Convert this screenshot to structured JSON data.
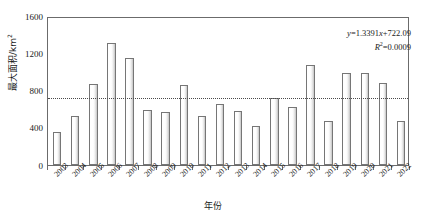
{
  "chart_data": {
    "type": "bar",
    "title": "",
    "xlabel": "年份",
    "ylabel": "最大面积/km²",
    "ylabel_base": "最大面积/km",
    "ylabel_sup": "2",
    "categories": [
      "2003",
      "2004",
      "2005",
      "2006",
      "2007",
      "2008",
      "2009",
      "2010",
      "2011",
      "2012",
      "2013",
      "2014",
      "2015",
      "2016",
      "2017",
      "2018",
      "2019",
      "2020",
      "2021",
      "2022"
    ],
    "values": [
      350,
      530,
      865,
      1310,
      1150,
      590,
      570,
      855,
      525,
      650,
      575,
      415,
      720,
      620,
      1075,
      470,
      985,
      985,
      885,
      470
    ],
    "ylim": [
      0,
      1600
    ],
    "yticks": [
      0,
      400,
      800,
      1200,
      1600
    ],
    "ytick_labels": [
      "0",
      "400",
      "800",
      "1200",
      "1600"
    ],
    "grid": false,
    "legend": "none",
    "series": [
      {
        "name": "最大面积",
        "values": [
          350,
          530,
          865,
          1310,
          1150,
          590,
          570,
          855,
          525,
          650,
          575,
          415,
          720,
          620,
          1075,
          470,
          985,
          985,
          885,
          470
        ]
      }
    ],
    "trendline": {
      "type": "linear",
      "slope": 1.3391,
      "intercept": 722.09,
      "r_squared": 0.0009,
      "style": "dotted",
      "color": "#4a4a4a",
      "equation_text": "y=1.3391x+722.09",
      "r2_text": "R2=0.0009",
      "equation_parts": {
        "lead": "y",
        "body": "=1.3391",
        "xvar": "x",
        "tail": "+722.09"
      },
      "r2_parts": {
        "lead": "R",
        "sup": "2",
        "tail": "=0.0009"
      }
    },
    "colors": {
      "bar_border": "#767676",
      "bar_fill_light": "#ffffff",
      "bar_fill_dark": "#c4c4c4",
      "axis": "#6b6b6b",
      "text": "#1a1a1a",
      "trendline": "#4a4a4a"
    }
  }
}
